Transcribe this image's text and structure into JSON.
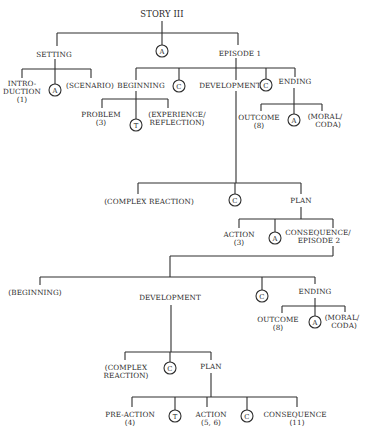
{
  "diagram": {
    "title": "STORY III",
    "circle_legend": {
      "A": "A",
      "C": "C",
      "T": "T"
    },
    "colors": {
      "line": "#2e2e2e",
      "text": "#2a2a2a",
      "background": "#ffffff"
    },
    "nodes": {
      "story": "STORY III",
      "setting": "SETTING",
      "episode1": "EPISODE 1",
      "introduction_l1": "INTRO-",
      "introduction_l2": "DUCTION",
      "introduction_l3": "(1)",
      "scenario": "(SCENARIO)",
      "beginning": "BEGINNING",
      "development": "DEVELOPMENT",
      "ending": "ENDING",
      "problem_l1": "PROBLEM",
      "problem_l2": "(3)",
      "experience_l1": "(EXPERIENCE/",
      "experience_l2": "REFLECTION)",
      "outcome1_l1": "OUTCOME",
      "outcome1_l2": "(8)",
      "moral1_l1": "(MORAL/",
      "moral1_l2": "CODA)",
      "complex_reaction1": "(COMPLEX REACTION)",
      "plan1": "PLAN",
      "action1_l1": "ACTION",
      "action1_l2": "(3)",
      "consequence1_l1": "CONSEQUENCE/",
      "consequence1_l2": "EPISODE  2",
      "beginning2": "(BEGINNING)",
      "development2": "DEVELOPMENT",
      "ending2": "ENDING",
      "outcome2_l1": "OUTCOME",
      "outcome2_l2": "(8)",
      "moral2_l1": "(MORAL/",
      "moral2_l2": "CODA)",
      "complex_reaction2_l1": "(COMPLEX",
      "complex_reaction2_l2": "REACTION)",
      "plan2": "PLAN",
      "preaction_l1": "PRE-ACTION",
      "preaction_l2": "(4)",
      "action2_l1": "ACTION",
      "action2_l2": "(5, 6)",
      "consequence2_l1": "CONSEQUENCE",
      "consequence2_l2": "(11)"
    },
    "connectors": {
      "story_and": "A",
      "setting_and": "A",
      "episode_cause1": "C",
      "episode_cause2": "C",
      "beginning_then": "T",
      "ending_and": "A",
      "development_cause": "C",
      "plan_and": "A",
      "episode2_cause": "C",
      "ending2_and": "A",
      "development2_cause": "C",
      "plan2_then": "T",
      "plan2_cause": "C"
    }
  }
}
